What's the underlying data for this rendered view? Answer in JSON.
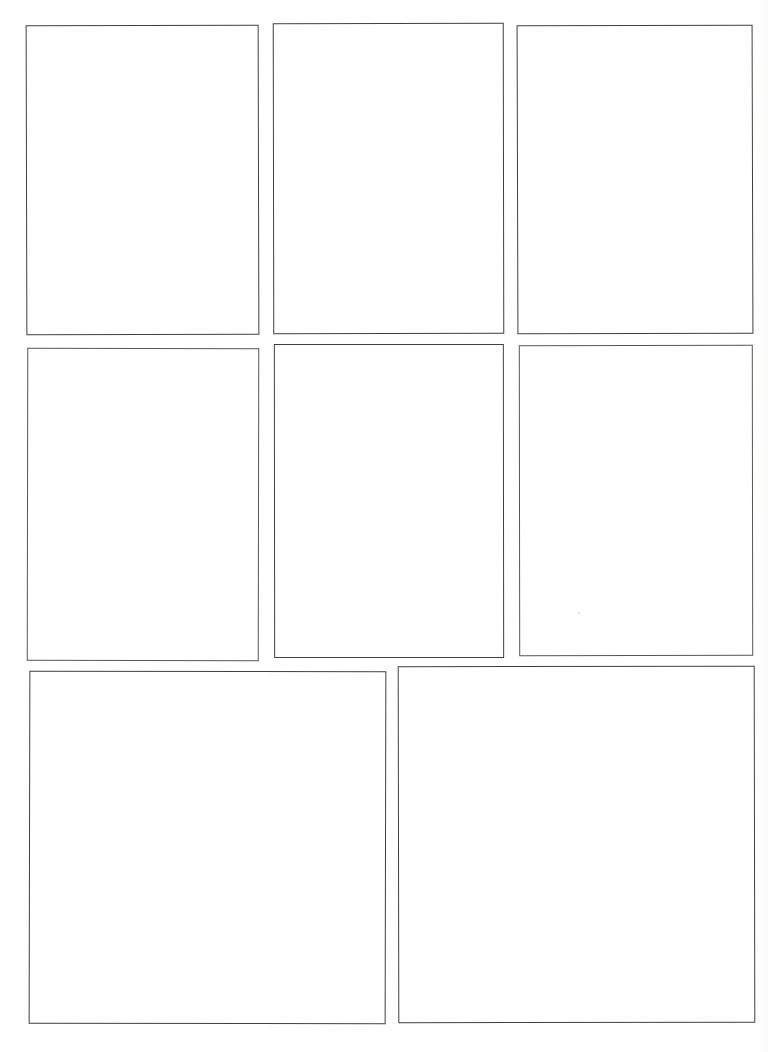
{
  "page": {
    "medium": "scanned paper",
    "background_color": "#ffffff",
    "ink_color": "#4a4a4f",
    "width_px": 768,
    "height_px": 1052,
    "panel_count": 8,
    "row_count": 3,
    "content_text": ""
  },
  "rows": [
    {
      "index": 1,
      "panel_count": 3,
      "label": ""
    },
    {
      "index": 2,
      "panel_count": 3,
      "label": ""
    },
    {
      "index": 3,
      "panel_count": 2,
      "label": ""
    }
  ],
  "panels": [
    {
      "id": "panel-1",
      "row": 1,
      "column": 1,
      "content": "",
      "caption": ""
    },
    {
      "id": "panel-2",
      "row": 1,
      "column": 2,
      "content": "",
      "caption": ""
    },
    {
      "id": "panel-3",
      "row": 1,
      "column": 3,
      "content": "",
      "caption": ""
    },
    {
      "id": "panel-4",
      "row": 2,
      "column": 1,
      "content": "",
      "caption": ""
    },
    {
      "id": "panel-5",
      "row": 2,
      "column": 2,
      "content": "",
      "caption": ""
    },
    {
      "id": "panel-6",
      "row": 2,
      "column": 3,
      "content": "",
      "caption": ""
    },
    {
      "id": "panel-7",
      "row": 3,
      "column": 1,
      "content": "",
      "caption": ""
    },
    {
      "id": "panel-8",
      "row": 3,
      "column": 2,
      "content": "",
      "caption": ""
    }
  ],
  "artifacts": [
    {
      "id": "scan-speck",
      "kind": "speck",
      "color": "#d8d8dc"
    }
  ]
}
